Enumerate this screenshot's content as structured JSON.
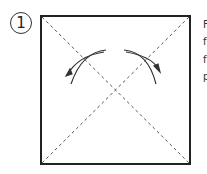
{
  "step": {
    "number": "1"
  },
  "diagram": {
    "square": {
      "x": 41,
      "y": 16,
      "size": 149
    },
    "colors": {
      "line": "#222222",
      "fold_line": "#555555"
    }
  },
  "side_text": {
    "lines": [
      "F",
      "f",
      "f",
      "p"
    ]
  }
}
